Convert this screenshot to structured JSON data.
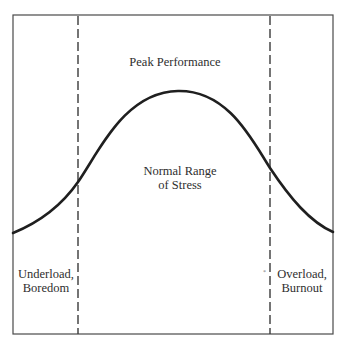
{
  "diagram": {
    "regions": [
      {
        "id": "underload",
        "lines": [
          "Underload,",
          "Boredom"
        ]
      },
      {
        "id": "normal",
        "lines": [
          "Normal Range",
          "of Stress"
        ]
      },
      {
        "id": "overload",
        "lines": [
          "Overload,",
          "Burnout"
        ]
      }
    ],
    "peak_label": "Peak Performance",
    "stray_mark": "*",
    "colors": {
      "line": "#1f1f1f",
      "frame": "#4a4a4a",
      "dashed": "#3a3a3a",
      "background": "#ffffff"
    },
    "curve": {
      "shape": "bell",
      "points": [
        {
          "x": 13,
          "y": 233
        },
        {
          "x": 78,
          "y": 182
        },
        {
          "x": 178,
          "y": 91
        },
        {
          "x": 270,
          "y": 168
        },
        {
          "x": 333,
          "y": 232
        }
      ]
    },
    "dividers": [
      {
        "x": 78,
        "style": "dashed"
      },
      {
        "x": 270,
        "style": "dashed"
      }
    ]
  }
}
